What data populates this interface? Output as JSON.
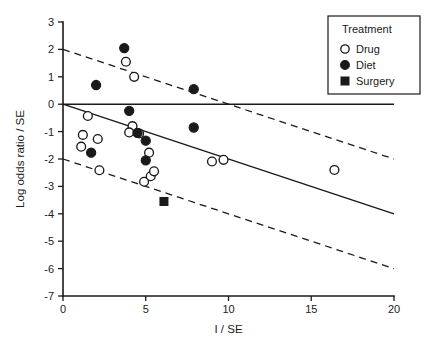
{
  "chart_data": {
    "type": "scatter",
    "title": "",
    "xlabel": "I / SE",
    "ylabel": "Log odds ratio / SE",
    "xlim": [
      0,
      20
    ],
    "ylim": [
      -7,
      3
    ],
    "xticks": [
      "0",
      "5",
      "10",
      "15",
      "20"
    ],
    "xtick_values": [
      0,
      5,
      10,
      15,
      20
    ],
    "yticks": [
      "3",
      "2",
      "1",
      "0",
      "-1",
      "-2",
      "-3",
      "-4",
      "-5",
      "-6",
      "-7"
    ],
    "ytick_values": [
      3,
      2,
      1,
      0,
      -1,
      -2,
      -3,
      -4,
      -5,
      -6,
      -7
    ],
    "grid": false,
    "legend": {
      "position": "top-right",
      "title": "Treatment",
      "entries": [
        {
          "label": "Drug",
          "marker": "open-circle"
        },
        {
          "label": "Diet",
          "marker": "filled-circle"
        },
        {
          "label": "Surgery",
          "marker": "filled-square"
        }
      ]
    },
    "lines": [
      {
        "name": "reference-line",
        "style": "solid",
        "x": [
          0,
          20
        ],
        "y": [
          0,
          0
        ]
      },
      {
        "name": "regression-line",
        "style": "solid",
        "x": [
          0,
          20
        ],
        "y": [
          0,
          -4
        ]
      },
      {
        "name": "upper-confidence-limit",
        "style": "dashed",
        "x": [
          0,
          20
        ],
        "y": [
          2,
          -2
        ]
      },
      {
        "name": "lower-confidence-limit",
        "style": "dashed",
        "x": [
          0,
          20
        ],
        "y": [
          -2,
          -6
        ]
      }
    ],
    "series": [
      {
        "name": "Drug",
        "marker": "open-circle",
        "points": [
          [
            1.2,
            -1.12
          ],
          [
            1.1,
            -1.55
          ],
          [
            1.5,
            -0.43
          ],
          [
            2.1,
            -1.27
          ],
          [
            2.2,
            -2.41
          ],
          [
            3.8,
            1.55
          ],
          [
            4.3,
            1.0
          ],
          [
            4.2,
            -0.8
          ],
          [
            4.0,
            -1.03
          ],
          [
            4.9,
            -2.83
          ],
          [
            5.2,
            -1.77
          ],
          [
            5.3,
            -2.63
          ],
          [
            5.5,
            -2.45
          ],
          [
            4.6,
            -1.07
          ],
          [
            9.0,
            -2.09
          ],
          [
            9.7,
            -2.03
          ],
          [
            16.4,
            -2.4
          ]
        ]
      },
      {
        "name": "Diet",
        "marker": "filled-circle",
        "points": [
          [
            2.0,
            0.7
          ],
          [
            3.7,
            2.05
          ],
          [
            4.0,
            -0.24
          ],
          [
            4.5,
            -1.05
          ],
          [
            5.0,
            -1.33
          ],
          [
            5.0,
            -2.05
          ],
          [
            1.7,
            -1.77
          ],
          [
            7.9,
            0.55
          ],
          [
            7.9,
            -0.85
          ]
        ]
      },
      {
        "name": "Surgery",
        "marker": "filled-square",
        "points": [
          [
            6.1,
            -3.55
          ]
        ]
      }
    ]
  }
}
